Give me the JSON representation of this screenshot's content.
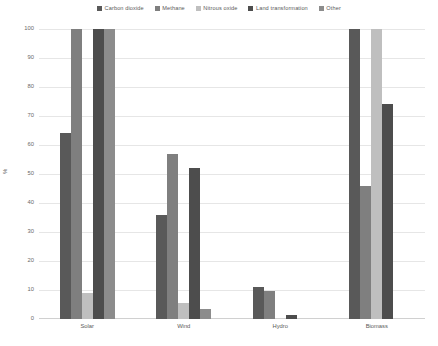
{
  "chart_data": {
    "type": "bar",
    "title": "",
    "xlabel": "",
    "ylabel": "%",
    "ylim": [
      0,
      100
    ],
    "ytick_step": 10,
    "yticks": [
      "100",
      "90",
      "80",
      "70",
      "60",
      "50",
      "40",
      "30",
      "20",
      "10",
      "0"
    ],
    "grid": true,
    "legend_position": "top-center",
    "categories": [
      "Solar",
      "Wind",
      "Hydro",
      "Biomass"
    ],
    "series": [
      {
        "name": "Carbon dioxide",
        "color": "#595959",
        "values": [
          64,
          36,
          11,
          100
        ]
      },
      {
        "name": "Methane",
        "color": "#7f7f7f",
        "values": [
          100,
          57,
          9.5,
          46
        ]
      },
      {
        "name": "Nitrous oxide",
        "color": "#bfbfbf",
        "values": [
          9,
          5.5,
          0,
          100
        ]
      },
      {
        "name": "Land transformation",
        "color": "#4d4d4d",
        "values": [
          100,
          52,
          1.5,
          74
        ]
      },
      {
        "name": "Other",
        "color": "#8c8c8c",
        "values": [
          100,
          3.5,
          0,
          0
        ]
      }
    ]
  },
  "colors": {
    "background": "#ffffff",
    "gridline": "#e6e6e6",
    "axis": "#d0d0d0",
    "text": "#5a5a5a"
  }
}
